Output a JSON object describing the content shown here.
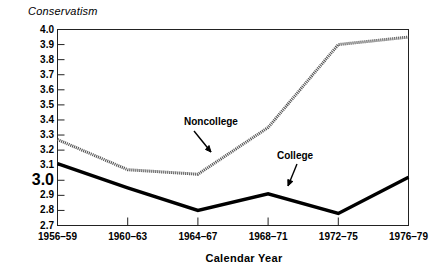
{
  "chart_data": {
    "type": "line",
    "title": "",
    "xlabel": "Calendar Year",
    "ylabel": "Conservatism",
    "categories": [
      "1956–59",
      "1960–63",
      "1964–67",
      "1968–71",
      "1972–75",
      "1976–79"
    ],
    "series": [
      {
        "name": "Noncollege",
        "values": [
          3.27,
          3.07,
          3.04,
          3.35,
          3.9,
          3.95
        ],
        "color": "#555555",
        "style": "hatched-gray"
      },
      {
        "name": "College",
        "values": [
          3.11,
          2.95,
          2.8,
          2.91,
          2.78,
          3.02
        ],
        "color": "#000000",
        "style": "solid-black"
      }
    ],
    "ylim": [
      2.7,
      4.0
    ],
    "ytick_labels": [
      "4.0",
      "3.9",
      "3.8",
      "3.7",
      "3.6",
      "3.5",
      "3.4",
      "3.3",
      "3.2",
      "3.1",
      "3.0",
      "2.9",
      "2.8",
      "2.7"
    ],
    "ytick_values": [
      4.0,
      3.9,
      3.8,
      3.7,
      3.6,
      3.5,
      3.4,
      3.3,
      3.2,
      3.1,
      3.0,
      2.9,
      2.8,
      2.7
    ],
    "ytick_emphasis": "3.0",
    "grid": false,
    "legend": "inline-annotations",
    "annotations": [
      {
        "label": "Noncollege",
        "points_to_series": "Noncollege"
      },
      {
        "label": "College",
        "points_to_series": "College"
      }
    ]
  },
  "axes": {
    "y_title": "Conservatism",
    "x_title": "Calendar Year"
  }
}
